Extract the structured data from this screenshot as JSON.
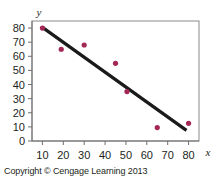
{
  "figure": {
    "caption": "Copyright © Cengage Learning 2013",
    "frame_color": "#8a8a8a",
    "axis_color": "#6e6e6e",
    "point_color": "#a32856",
    "line_color": "#1a1a1a"
  },
  "chart_data": {
    "type": "scatter",
    "title": "",
    "xlabel": "x",
    "ylabel": "y",
    "xlim": [
      5,
      85
    ],
    "ylim": [
      0,
      85
    ],
    "xticks": [
      10,
      20,
      30,
      40,
      50,
      60,
      70,
      80
    ],
    "yticks": [
      0,
      10,
      20,
      30,
      40,
      50,
      60,
      70,
      80
    ],
    "xticklabels": [
      "10",
      "20",
      "30",
      "40",
      "50",
      "60",
      "70",
      "80"
    ],
    "yticklabels": [
      "0",
      "10",
      "20",
      "30",
      "40",
      "50",
      "60",
      "70",
      "80"
    ],
    "grid": false,
    "legend": null,
    "points": [
      {
        "x": 10,
        "y": 80
      },
      {
        "x": 19,
        "y": 65
      },
      {
        "x": 30,
        "y": 68
      },
      {
        "x": 45,
        "y": 55
      },
      {
        "x": 50.5,
        "y": 35
      },
      {
        "x": 65,
        "y": 9.5
      },
      {
        "x": 80,
        "y": 12.5
      }
    ],
    "series": [
      {
        "name": "data",
        "type": "scatter",
        "x": [
          10,
          19,
          30,
          45,
          50.5,
          65,
          80
        ],
        "values": [
          80,
          65,
          68,
          55,
          35,
          9.5,
          12.5
        ]
      },
      {
        "name": "trend-line",
        "type": "line",
        "x": [
          10,
          79
        ],
        "values": [
          80.5,
          7.5
        ]
      }
    ]
  }
}
